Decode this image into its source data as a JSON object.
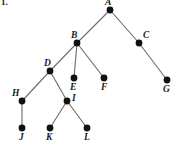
{
  "figure": {
    "problem_number": "1.",
    "background_color": "#ffffff",
    "node_color": "#111111",
    "edge_color": "#6b6b6b",
    "label_color": "#1a1a1a",
    "width": 173,
    "height": 142
  },
  "diagram_data": {
    "type": "tree",
    "nodes": [
      {
        "id": "A",
        "label": "A",
        "x": 110,
        "y": 10,
        "label_x": 105,
        "label_y": -2,
        "radius": 3.4
      },
      {
        "id": "B",
        "label": "B",
        "x": 77,
        "y": 43,
        "label_x": 71,
        "label_y": 31,
        "radius": 3.4
      },
      {
        "id": "C",
        "label": "C",
        "x": 139,
        "y": 43,
        "label_x": 143,
        "label_y": 31,
        "radius": 3.4
      },
      {
        "id": "D",
        "label": "D",
        "x": 50,
        "y": 71,
        "label_x": 44,
        "label_y": 59,
        "radius": 3.4
      },
      {
        "id": "E",
        "label": "E",
        "x": 74,
        "y": 78,
        "label_x": 70,
        "label_y": 83,
        "radius": 3.4
      },
      {
        "id": "F",
        "label": "F",
        "x": 104,
        "y": 78,
        "label_x": 101,
        "label_y": 83,
        "radius": 3.4
      },
      {
        "id": "G",
        "label": "G",
        "x": 167,
        "y": 80,
        "label_x": 163,
        "label_y": 85,
        "radius": 3.4
      },
      {
        "id": "H",
        "label": "H",
        "x": 22,
        "y": 101,
        "label_x": 12,
        "label_y": 89,
        "radius": 3.4
      },
      {
        "id": "I",
        "label": "I",
        "x": 67,
        "y": 101,
        "label_x": 72,
        "label_y": 94,
        "radius": 3.4
      },
      {
        "id": "J",
        "label": "J",
        "x": 22,
        "y": 128,
        "label_x": 19,
        "label_y": 133,
        "radius": 3.4
      },
      {
        "id": "K",
        "label": "K",
        "x": 50,
        "y": 128,
        "label_x": 46,
        "label_y": 133,
        "radius": 3.4
      },
      {
        "id": "L",
        "label": "L",
        "x": 87,
        "y": 128,
        "label_x": 84,
        "label_y": 133,
        "radius": 3.4
      }
    ],
    "edges": [
      {
        "from": "A",
        "to": "B"
      },
      {
        "from": "A",
        "to": "C"
      },
      {
        "from": "B",
        "to": "D"
      },
      {
        "from": "B",
        "to": "E"
      },
      {
        "from": "B",
        "to": "F"
      },
      {
        "from": "C",
        "to": "G"
      },
      {
        "from": "D",
        "to": "H"
      },
      {
        "from": "D",
        "to": "I"
      },
      {
        "from": "H",
        "to": "J"
      },
      {
        "from": "I",
        "to": "K"
      },
      {
        "from": "I",
        "to": "L"
      }
    ]
  }
}
